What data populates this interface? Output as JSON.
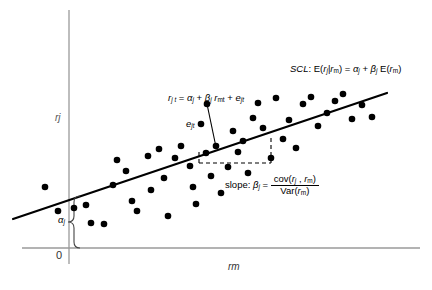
{
  "figure": {
    "type": "scatter-with-regression",
    "title_annotation": "SCL: E(rj| rm) = αj + βj E(rm)",
    "axes": {
      "y_label": "rj",
      "x_label": "rm",
      "origin_label": "0",
      "x_axis_color": "#9a9a9a",
      "y_axis_color": "#9a9a9a"
    },
    "annotations": {
      "scl_prefix": "SCL",
      "scl_colon": ":",
      "scl_body_1": "E(",
      "scl_r_j": "r",
      "scl_sub_j": "j",
      "scl_bar": "|",
      "scl_r_m": "r",
      "scl_sub_m": "m",
      "scl_close_eq": ") = ",
      "scl_alpha": "α",
      "scl_alpha_sub": "j",
      "scl_plus": " + ",
      "scl_beta": "β",
      "scl_beta_sub": "j",
      "scl_tail": " E(",
      "scl_tail_r": "r",
      "scl_tail_sub": "m",
      "scl_tail_close": ")",
      "reg_r": "r",
      "reg_sub_jt": "j t",
      "reg_eq": " = ",
      "reg_alpha": "α",
      "reg_alpha_sub": "j",
      "reg_plus1": " + ",
      "reg_beta": "β",
      "reg_beta_sub": "j",
      "reg_rm": " r",
      "reg_rm_sub": "mt",
      "reg_plus2": " + ",
      "reg_e": "e",
      "reg_e_sub": "jt",
      "residual_e": "e",
      "residual_sub": "jt",
      "slope_label": "slope: ",
      "slope_beta": "β",
      "slope_beta_sub": "j",
      "slope_equals": " = ",
      "slope_numerator": "cov(rj , rm)",
      "slope_num_cov": "cov(",
      "slope_num_r1": "r",
      "slope_num_sub1": "j",
      "slope_num_comma": " , ",
      "slope_num_r2": "r",
      "slope_num_sub2": "m",
      "slope_num_close": ")",
      "slope_den_var": "Var(",
      "slope_den_r": "r",
      "slope_den_sub": "m",
      "slope_den_close": ")",
      "intercept_alpha": "α",
      "intercept_alpha_sub": "j"
    }
  },
  "chart_data": {
    "type": "scatter",
    "xlabel": "rm",
    "ylabel": "rj",
    "grid": false,
    "legend": null,
    "line": {
      "name": "SCL regression line",
      "x0_px": 13,
      "y0_px": 219,
      "x1_px": 387,
      "y1_px": 93,
      "color": "#000000",
      "width_px": 2.2
    },
    "point_color": "#000000",
    "point_radius_px": 3.3,
    "points_px": [
      [
        45,
        187
      ],
      [
        58,
        211
      ],
      [
        74,
        208
      ],
      [
        86,
        205
      ],
      [
        91,
        223
      ],
      [
        104,
        224
      ],
      [
        113,
        185
      ],
      [
        117,
        160
      ],
      [
        126,
        171
      ],
      [
        132,
        201
      ],
      [
        137,
        211
      ],
      [
        148,
        156
      ],
      [
        151,
        190
      ],
      [
        159,
        149
      ],
      [
        164,
        178
      ],
      [
        168,
        216
      ],
      [
        175,
        158
      ],
      [
        181,
        146
      ],
      [
        190,
        166
      ],
      [
        193,
        187
      ],
      [
        196,
        204
      ],
      [
        201,
        124
      ],
      [
        206,
        153
      ],
      [
        211,
        176
      ],
      [
        216,
        146
      ],
      [
        221,
        193
      ],
      [
        228,
        167
      ],
      [
        233,
        131
      ],
      [
        238,
        152
      ],
      [
        243,
        141
      ],
      [
        248,
        173
      ],
      [
        253,
        118
      ],
      [
        258,
        103
      ],
      [
        263,
        128
      ],
      [
        271,
        158
      ],
      [
        276,
        98
      ],
      [
        283,
        139
      ],
      [
        289,
        120
      ],
      [
        296,
        148
      ],
      [
        303,
        104
      ],
      [
        311,
        97
      ],
      [
        318,
        126
      ],
      [
        327,
        113
      ],
      [
        335,
        101
      ],
      [
        343,
        94
      ],
      [
        352,
        119
      ],
      [
        362,
        105
      ],
      [
        372,
        117
      ]
    ],
    "residual_marker": {
      "point_px": [
        207,
        104
      ],
      "foot_px": [
        216,
        147
      ],
      "label": "ejt"
    },
    "slope_triangle_px": {
      "x_left": 199,
      "x_right": 271,
      "y_bottom": 163,
      "y_top": 138,
      "style": "dashed"
    },
    "alpha_brace_px": {
      "x": 78,
      "y_top": 196,
      "y_bottom": 248
    }
  }
}
